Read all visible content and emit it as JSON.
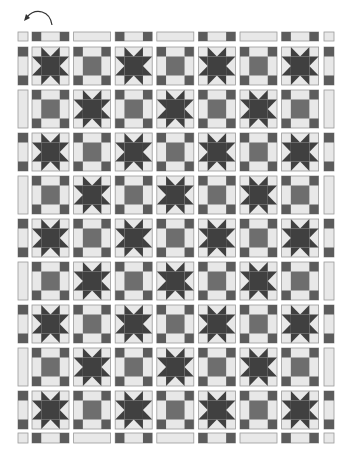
{
  "toolbar": {
    "rotate_icon": "rotate-counterclockwise-icon"
  },
  "colors": {
    "background": "#ffffff",
    "light": "#e8e8e8",
    "dark": "#5c5c5c",
    "center": "#6e6e6e",
    "star": "#404040",
    "outline": "#9a9a9a"
  },
  "quilt": {
    "pattern_name": "Star and Nine-Patch alternating quilt",
    "rows": 9,
    "cols": 7,
    "layout": {
      "col_x": [
        32,
        73.6,
        115.2,
        156.8,
        198.4,
        240,
        281.6
      ],
      "row_y": [
        47,
        90,
        133,
        176,
        219,
        262,
        305,
        348,
        391
      ],
      "block_w": 37,
      "block_h": 38,
      "left_sash_x": 18,
      "right_sash_x": 324,
      "side_sash_w": 10,
      "top_sash_y": 32,
      "top_sash_h": 9,
      "bottom_sash_y": 433,
      "bottom_sash_h": 10
    },
    "block_types": [
      "star",
      "square-in-square"
    ],
    "grid": [
      [
        "star",
        "square",
        "star",
        "square",
        "star",
        "square",
        "star"
      ],
      [
        "square",
        "star",
        "square",
        "star",
        "square",
        "star",
        "square"
      ],
      [
        "star",
        "square",
        "star",
        "square",
        "star",
        "square",
        "star"
      ],
      [
        "square",
        "star",
        "square",
        "star",
        "square",
        "star",
        "square"
      ],
      [
        "star",
        "square",
        "star",
        "square",
        "star",
        "square",
        "star"
      ],
      [
        "square",
        "star",
        "square",
        "star",
        "square",
        "star",
        "square"
      ],
      [
        "star",
        "square",
        "star",
        "square",
        "star",
        "square",
        "star"
      ],
      [
        "square",
        "star",
        "square",
        "star",
        "square",
        "star",
        "square"
      ],
      [
        "star",
        "square",
        "star",
        "square",
        "star",
        "square",
        "star"
      ]
    ]
  }
}
